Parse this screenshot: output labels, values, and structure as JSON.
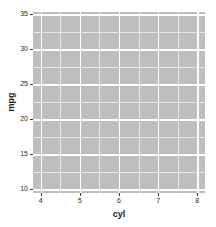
{
  "chart_data": {
    "type": "scatter",
    "title": "",
    "subtitle": "",
    "xlabel": "cyl",
    "ylabel": "mpg",
    "xlim": [
      3.8,
      8.2
    ],
    "ylim": [
      9.45,
      35.35
    ],
    "x_ticks": [
      4,
      5,
      6,
      7,
      8
    ],
    "x_tick_labels": [
      "4",
      "5",
      "6",
      "7",
      "8"
    ],
    "y_ticks": [
      10,
      15,
      20,
      25,
      30,
      35
    ],
    "y_tick_labels": [
      "10",
      "15",
      "20",
      "25",
      "30",
      "35"
    ],
    "x_minor_ticks": [
      4.5,
      5.5,
      6.5,
      7.5
    ],
    "y_minor_ticks": [
      12.5,
      17.5,
      22.5,
      27.5,
      32.5
    ],
    "grid": true,
    "legend": false,
    "legend_position": "none",
    "series": [
      {
        "name": "",
        "x": [],
        "y": []
      }
    ],
    "annotations": [],
    "panel_background": "#bebebe",
    "gridline_color": "#ffffff",
    "plot_background": "#ffffff",
    "axis_text_color": "#2b2b2b"
  },
  "axes": {
    "x_title": "cyl",
    "y_title": "mpg"
  }
}
